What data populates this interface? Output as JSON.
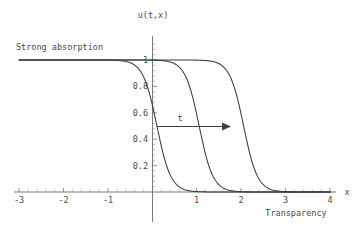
{
  "figure": {
    "background_color": "#ffffff",
    "curve_color": "#3a3a3a",
    "axis_color": "#6b6b6b",
    "text_color": "#4a4a4a"
  },
  "labels": {
    "y_axis_title": "u(t,x)",
    "x_axis_title": "x",
    "left_annotation": "Strong absorption",
    "right_annotation": "Transparency",
    "arrow_annotation": "t"
  },
  "chart_data": {
    "type": "line",
    "title": "",
    "subtitle": "",
    "xlabel": "x",
    "ylabel": "u(t,x)",
    "xlim": [
      -3,
      4
    ],
    "ylim": [
      0,
      1.08
    ],
    "grid": false,
    "legend_position": "none",
    "xticks": [
      -3,
      -2,
      -1,
      1,
      2,
      3,
      4
    ],
    "xtick_labels": [
      "-3",
      "-2",
      "-1",
      "1",
      "2",
      "3",
      "4"
    ],
    "yticks": [
      0.2,
      0.4,
      0.6,
      0.8,
      1
    ],
    "ytick_labels": [
      "0.2",
      "0.4",
      "0.6",
      "0.8",
      "1"
    ],
    "annotations": [
      {
        "text": "Strong absorption",
        "x": -2.7,
        "y": 1.06
      },
      {
        "text": "Transparency",
        "x": 3.2,
        "y": -0.17
      },
      {
        "text": "t",
        "x": 0.72,
        "y": 0.58
      },
      {
        "text": "arrow",
        "x_start": 0.12,
        "x_end": 1.72,
        "y": 0.5
      }
    ],
    "series": [
      {
        "name": "t1",
        "midpoint": 0.1,
        "steepness": 3.2,
        "x": [
          -3,
          -2.75,
          -2.5,
          -2.25,
          -2,
          -1.75,
          -1.5,
          -1.25,
          -1,
          -0.75,
          -0.5,
          -0.25,
          0,
          0.25,
          0.5,
          0.75,
          1,
          1.25,
          1.5,
          1.75,
          2,
          2.5,
          3,
          3.5,
          4
        ],
        "values": [
          0.9999,
          0.9998,
          0.9995,
          0.999,
          0.9981,
          0.9963,
          0.9928,
          0.986,
          0.9727,
          0.9475,
          0.9013,
          0.8229,
          0.7068,
          0.5622,
          0.4128,
          0.2836,
          0.1857,
          0.1174,
          0.0726,
          0.0443,
          0.0268,
          0.0097,
          0.0035,
          0.0012,
          0.0004
        ]
      },
      {
        "name": "t2",
        "midpoint": 1.05,
        "steepness": 3.2,
        "x": [
          -3,
          -2.75,
          -2.5,
          -2.25,
          -2,
          -1.75,
          -1.5,
          -1.25,
          -1,
          -0.75,
          -0.5,
          -0.25,
          0,
          0.25,
          0.5,
          0.75,
          1,
          1.25,
          1.5,
          1.75,
          2,
          2.25,
          2.5,
          3,
          3.5,
          4
        ],
        "values": [
          1.0,
          1.0,
          0.9999,
          0.9999,
          0.9998,
          0.9995,
          0.999,
          0.998,
          0.9961,
          0.9922,
          0.9846,
          0.9699,
          0.9419,
          0.8913,
          0.8091,
          0.6916,
          0.5513,
          0.4099,
          0.2866,
          0.1917,
          0.1244,
          0.0788,
          0.0492,
          0.0186,
          0.0068,
          0.0025
        ]
      },
      {
        "name": "t3",
        "midpoint": 2.05,
        "steepness": 3.2,
        "x": [
          -3,
          -2.5,
          -2,
          -1.5,
          -1,
          -0.5,
          0,
          0.25,
          0.5,
          0.75,
          1,
          1.25,
          1.5,
          1.75,
          2,
          2.25,
          2.5,
          2.75,
          3,
          3.25,
          3.5,
          3.75,
          4
        ],
        "values": [
          1.0,
          1.0,
          1.0,
          1.0,
          0.9998,
          0.9994,
          0.9987,
          0.9979,
          0.9966,
          0.9945,
          0.9912,
          0.9858,
          0.9771,
          0.9632,
          0.9413,
          0.9074,
          0.8567,
          0.7848,
          0.6904,
          0.5783,
          0.4595,
          0.3464,
          0.2485
        ]
      }
    ]
  }
}
